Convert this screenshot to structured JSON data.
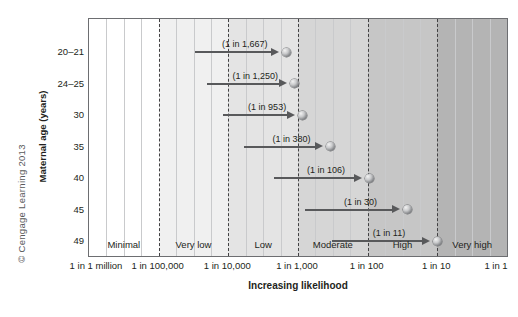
{
  "credit": "© Cengage Learning 2013",
  "chart_data": {
    "type": "scatter",
    "title": "",
    "xlabel": "Increasing likelihood",
    "ylabel": "Maternal age (years)",
    "grid": true,
    "legend": "none",
    "x_scale": "logarithmic",
    "x_tick_labels": [
      "1 in 1 million",
      "1 in 100,000",
      "1 in 10,000",
      "1 in 1,000",
      "1 in 100",
      "1 in 10",
      "1 in 1"
    ],
    "x_tick_values": [
      1000000,
      100000,
      10000,
      1000,
      100,
      10,
      1
    ],
    "categories": [
      "20–21",
      "24–25",
      "30",
      "35",
      "40",
      "45",
      "49"
    ],
    "risk_bands": [
      {
        "label": "Minimal",
        "from": 1000000,
        "to": 100000
      },
      {
        "label": "Very low",
        "from": 100000,
        "to": 10000
      },
      {
        "label": "Low",
        "from": 10000,
        "to": 1000
      },
      {
        "label": "Moderate",
        "from": 1000,
        "to": 100
      },
      {
        "label": "High",
        "from": 100,
        "to": 10
      },
      {
        "label": "Very high",
        "from": 10,
        "to": 1
      }
    ],
    "points": [
      {
        "age": "20–21",
        "label": "(1 in 1,667)",
        "denominator": 1667,
        "bar_start": 30000
      },
      {
        "age": "24–25",
        "label": "(1 in 1,250)",
        "denominator": 1250,
        "bar_start": 20000
      },
      {
        "age": "30",
        "label": "(1 in 953)",
        "denominator": 953,
        "bar_start": 12000
      },
      {
        "age": "35",
        "label": "(1 in 380)",
        "denominator": 380,
        "bar_start": 6000
      },
      {
        "age": "40",
        "label": "(1 in 106)",
        "denominator": 106,
        "bar_start": 2200
      },
      {
        "age": "45",
        "label": "(1 in 30)",
        "denominator": 30,
        "bar_start": 800
      },
      {
        "age": "49",
        "label": "(1 in 11)",
        "denominator": 11,
        "bar_start": 330
      }
    ]
  }
}
